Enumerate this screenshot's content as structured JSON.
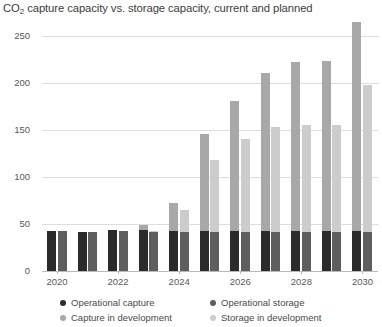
{
  "chart_data": {
    "type": "bar",
    "title": "CO2 capture capacity vs. storage capacity, current and planned",
    "title_prefix": "CO",
    "title_sub": "2",
    "title_rest": " capture capacity vs. storage capacity, current and planned",
    "xlabel": "",
    "ylabel": "",
    "ylim": [
      0,
      275
    ],
    "grid": true,
    "stacked": true,
    "legend_position": "bottom",
    "categories": [
      "2020",
      "2021",
      "2022",
      "2023",
      "2024",
      "2025",
      "2026",
      "2027",
      "2028",
      "2029",
      "2030"
    ],
    "tick_labels": [
      "2020",
      "2022",
      "2024",
      "2026",
      "2028",
      "2030"
    ],
    "y_ticks": [
      0,
      50,
      100,
      150,
      200,
      250
    ],
    "series": [
      {
        "name": "Operational capture",
        "color": "#2b2b2b",
        "group": "capture",
        "values": [
          43,
          42,
          44,
          44,
          43,
          43,
          43,
          43,
          43,
          43,
          43
        ]
      },
      {
        "name": "Capture in development",
        "color": "#a8a8a8",
        "group": "capture",
        "values": [
          0,
          0,
          0,
          5,
          29,
          103,
          138,
          168,
          179,
          180,
          222
        ]
      },
      {
        "name": "Operational storage",
        "color": "#5e5e5e",
        "group": "storage",
        "values": [
          43,
          42,
          43,
          42,
          42,
          42,
          42,
          42,
          42,
          42,
          42
        ]
      },
      {
        "name": "Storage in development",
        "color": "#cccccc",
        "group": "storage",
        "values": [
          0,
          0,
          0,
          1,
          23,
          76,
          98,
          111,
          113,
          113,
          156
        ]
      }
    ],
    "totals": {
      "capture": [
        43,
        42,
        44,
        49,
        72,
        146,
        181,
        211,
        222,
        223,
        265
      ],
      "storage": [
        43,
        42,
        43,
        43,
        65,
        118,
        140,
        153,
        155,
        155,
        198
      ]
    }
  }
}
